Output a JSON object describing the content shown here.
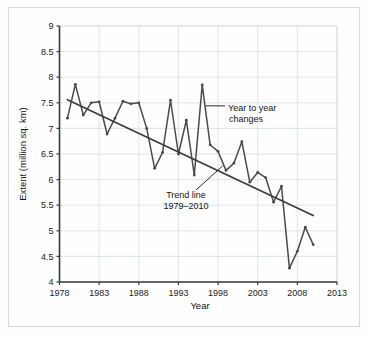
{
  "figure": {
    "background_color": "#fefefe",
    "border_color": "#d8d8d8"
  },
  "chart_data": {
    "type": "line",
    "title": "",
    "xlabel": "Year",
    "ylabel": "Extent (million sq. km)",
    "xlim": [
      1978,
      2013
    ],
    "ylim": [
      4,
      9
    ],
    "grid": true,
    "legend_position": "none",
    "xticks": [
      "1978",
      "1983",
      "1988",
      "1993",
      "1998",
      "2003",
      "2008",
      "2013"
    ],
    "xtick_values": [
      1978,
      1983,
      1988,
      1993,
      1998,
      2003,
      2008,
      2013
    ],
    "yticks": [
      "4",
      "4.5",
      "5",
      "5.5",
      "6",
      "6.5",
      "7",
      "7.5",
      "8",
      "8.5",
      "9"
    ],
    "ytick_values": [
      4,
      4.5,
      5,
      5.5,
      6,
      6.5,
      7,
      7.5,
      8,
      8.5,
      9
    ],
    "series": [
      {
        "name": "Year to year changes",
        "color": "#4a4a4a",
        "marker": "dot",
        "x": [
          1979,
          1980,
          1981,
          1982,
          1983,
          1984,
          1985,
          1986,
          1987,
          1988,
          1989,
          1990,
          1991,
          1992,
          1993,
          1994,
          1995,
          1996,
          1997,
          1998,
          1999,
          2000,
          2001,
          2002,
          2003,
          2004,
          2005,
          2006,
          2007,
          2008,
          2009,
          2010
        ],
        "values": [
          7.2,
          7.86,
          7.26,
          7.5,
          7.52,
          6.89,
          7.2,
          7.53,
          7.48,
          7.5,
          7.0,
          6.22,
          6.53,
          7.55,
          6.5,
          7.16,
          6.09,
          7.85,
          6.68,
          6.55,
          6.18,
          6.32,
          6.74,
          5.95,
          6.14,
          6.04,
          5.56,
          5.87,
          4.27,
          4.6,
          5.07,
          4.73
        ]
      },
      {
        "name": "Trend line 1979-2010",
        "color": "#3d3d3d",
        "marker": "none",
        "x": [
          1979,
          2010
        ],
        "values": [
          7.56,
          5.3
        ]
      }
    ],
    "annotations": [
      {
        "id": "year-to-year-changes",
        "line1": "Year to year",
        "line2": "changes",
        "target_x": 1996.4,
        "target_y": 7.44
      },
      {
        "id": "trend-line",
        "line1": "Trend line",
        "line2": "1979–2010",
        "target_x": 1998.6,
        "target_y": 6.27
      }
    ]
  }
}
